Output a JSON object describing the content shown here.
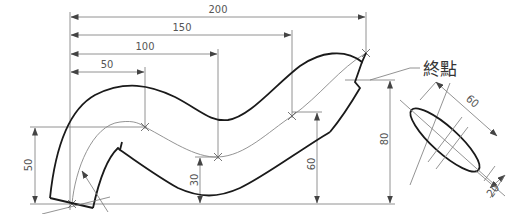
{
  "drawing": {
    "title": "Swept pipe path with elliptical section",
    "end_label": "終點",
    "horizontal_dims": [
      {
        "value": "200",
        "x": 366,
        "y": 17
      },
      {
        "value": "150",
        "x": 292,
        "y": 35
      },
      {
        "value": "100",
        "x": 218,
        "y": 54
      },
      {
        "value": "50",
        "x": 145,
        "y": 72
      }
    ],
    "vertical_dims": [
      {
        "value": "50",
        "x": 35,
        "top": 127
      },
      {
        "value": "30",
        "x": 200,
        "top": 157
      },
      {
        "value": "60",
        "x": 317,
        "top": 112
      },
      {
        "value": "80",
        "x": 390,
        "top": 80
      }
    ],
    "path_points": [
      {
        "x": 72,
        "y": 204
      },
      {
        "x": 145,
        "y": 127
      },
      {
        "x": 218,
        "y": 157
      },
      {
        "x": 292,
        "y": 116
      },
      {
        "x": 366,
        "y": 53
      }
    ],
    "ellipse_dims": {
      "major": "60",
      "minor": "20"
    },
    "colors": {
      "outline": "#1a1a1a",
      "centerline": "#888888",
      "dimension": "#777777"
    }
  }
}
